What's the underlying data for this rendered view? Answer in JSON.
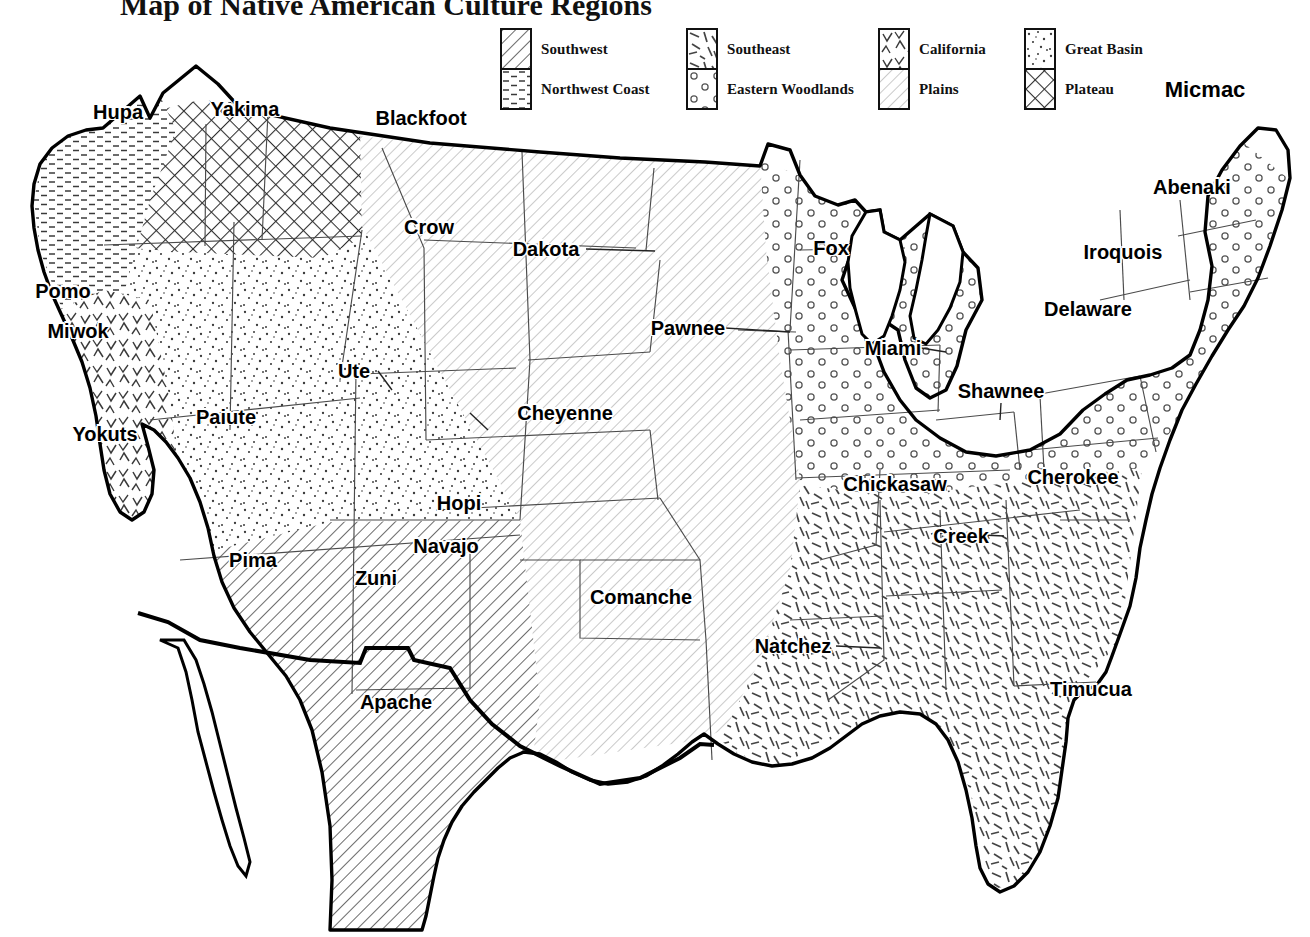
{
  "title": "Map of Native American Culture Regions",
  "legend": {
    "items": [
      {
        "key": "southwest",
        "label": "Southwest",
        "pattern": "diagonal-hatch-dense",
        "col": 0,
        "row": 0
      },
      {
        "key": "northwest-coast",
        "label": "Northwest Coast",
        "pattern": "horizontal-dashes",
        "col": 0,
        "row": 1
      },
      {
        "key": "southeast",
        "label": "Southeast",
        "pattern": "random-dashes",
        "col": 1,
        "row": 0
      },
      {
        "key": "eastern-woodlands",
        "label": "Eastern Woodlands",
        "pattern": "small-circles",
        "col": 1,
        "row": 1
      },
      {
        "key": "california",
        "label": "California",
        "pattern": "chevrons",
        "col": 2,
        "row": 0
      },
      {
        "key": "plains",
        "label": "Plains",
        "pattern": "diagonal-hatch-light",
        "col": 2,
        "row": 1
      },
      {
        "key": "great-basin",
        "label": "Great Basin",
        "pattern": "stipple-dots",
        "col": 3,
        "row": 0
      },
      {
        "key": "plateau",
        "label": "Plateau",
        "pattern": "crosshatch",
        "col": 3,
        "row": 1
      }
    ]
  },
  "map": {
    "regions": [
      {
        "key": "southwest",
        "label": "Southwest"
      },
      {
        "key": "northwest-coast",
        "label": "Northwest Coast"
      },
      {
        "key": "southeast",
        "label": "Southeast"
      },
      {
        "key": "eastern-woodlands",
        "label": "Eastern Woodlands"
      },
      {
        "key": "california",
        "label": "California"
      },
      {
        "key": "plains",
        "label": "Plains"
      },
      {
        "key": "great-basin",
        "label": "Great Basin"
      },
      {
        "key": "plateau",
        "label": "Plateau"
      }
    ],
    "tribes": [
      {
        "name": "Hupa",
        "x": 118,
        "y": 112,
        "region": "northwest-coast"
      },
      {
        "name": "Yakima",
        "x": 245,
        "y": 109,
        "region": "plateau"
      },
      {
        "name": "Blackfoot",
        "x": 421,
        "y": 118,
        "region": "plains"
      },
      {
        "name": "Micmac",
        "x": 1205,
        "y": 90,
        "region": "eastern-woodlands"
      },
      {
        "name": "Abenaki",
        "x": 1192,
        "y": 187,
        "region": "eastern-woodlands"
      },
      {
        "name": "Crow",
        "x": 429,
        "y": 227,
        "region": "plains"
      },
      {
        "name": "Dakota",
        "x": 546,
        "y": 249,
        "region": "plains"
      },
      {
        "name": "Fox",
        "x": 831,
        "y": 248,
        "region": "eastern-woodlands"
      },
      {
        "name": "Iroquois",
        "x": 1123,
        "y": 252,
        "region": "eastern-woodlands"
      },
      {
        "name": "Pomo",
        "x": 63,
        "y": 291,
        "region": "california"
      },
      {
        "name": "Delaware",
        "x": 1088,
        "y": 309,
        "region": "eastern-woodlands"
      },
      {
        "name": "Pawnee",
        "x": 688,
        "y": 328,
        "region": "plains"
      },
      {
        "name": "Miwok",
        "x": 78,
        "y": 331,
        "region": "california"
      },
      {
        "name": "Miami",
        "x": 893,
        "y": 348,
        "region": "eastern-woodlands"
      },
      {
        "name": "Ute",
        "x": 354,
        "y": 371,
        "region": "great-basin"
      },
      {
        "name": "Shawnee",
        "x": 1001,
        "y": 391,
        "region": "eastern-woodlands"
      },
      {
        "name": "Cheyenne",
        "x": 565,
        "y": 413,
        "region": "plains"
      },
      {
        "name": "Yokuts",
        "x": 105,
        "y": 434,
        "region": "california"
      },
      {
        "name": "Paiute",
        "x": 226,
        "y": 417,
        "region": "great-basin"
      },
      {
        "name": "Cherokee",
        "x": 1073,
        "y": 477,
        "region": "southeast"
      },
      {
        "name": "Hopi",
        "x": 459,
        "y": 503,
        "region": "great-basin"
      },
      {
        "name": "Chickasaw",
        "x": 895,
        "y": 484,
        "region": "eastern-woodlands"
      },
      {
        "name": "Creek",
        "x": 961,
        "y": 536,
        "region": "southeast"
      },
      {
        "name": "Navajo",
        "x": 446,
        "y": 546,
        "region": "southwest"
      },
      {
        "name": "Pima",
        "x": 253,
        "y": 560,
        "region": "southwest"
      },
      {
        "name": "Zuni",
        "x": 376,
        "y": 578,
        "region": "southwest"
      },
      {
        "name": "Comanche",
        "x": 641,
        "y": 597,
        "region": "plains"
      },
      {
        "name": "Natchez",
        "x": 793,
        "y": 646,
        "region": "southeast"
      },
      {
        "name": "Timucua",
        "x": 1091,
        "y": 689,
        "region": "southeast"
      },
      {
        "name": "Apache",
        "x": 396,
        "y": 702,
        "region": "southwest"
      }
    ]
  },
  "colors": {
    "ink": "#000000",
    "paper": "#ffffff",
    "pattern_line": "#333333",
    "border_line": "#222222"
  }
}
